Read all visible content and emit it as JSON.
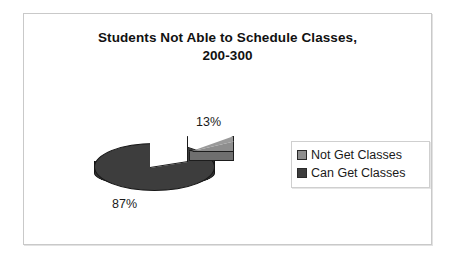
{
  "chart_data": {
    "type": "pie",
    "title": "Students Not Able to Schedule Classes, 200-300",
    "title_line_1": "Students Not Able to Schedule Classes,",
    "title_line_2": "200-300",
    "categories": [
      "Not Get Classes",
      "Can Get Classes"
    ],
    "values": [
      13,
      87
    ],
    "value_labels": [
      "13%",
      "87%"
    ],
    "colors": [
      "#8e8e8e",
      "#3d3d3d"
    ],
    "exploded": [
      "Not Get Classes"
    ],
    "three_d": true,
    "legend_position": "right",
    "grid": false,
    "xlabel": "",
    "ylabel": ""
  },
  "legend": {
    "entries": [
      {
        "label": "Not Get Classes",
        "color": "#8e8e8e"
      },
      {
        "label": "Can Get Classes",
        "color": "#3d3d3d"
      }
    ]
  },
  "slices": {
    "not_get_classes": {
      "label": "13%"
    },
    "can_get_classes": {
      "label": "87%"
    }
  }
}
